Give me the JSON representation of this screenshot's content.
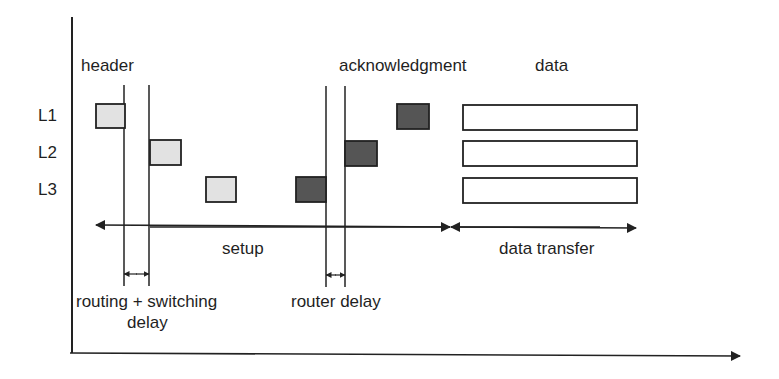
{
  "diagram": {
    "type": "timing-diagram",
    "labels": {
      "header": "header",
      "acknowledgment": "acknowledgment",
      "data": "data",
      "setup": "setup",
      "data_transfer": "data transfer",
      "routing_switching_line1": "routing + switching",
      "routing_switching_line2": "delay",
      "router_delay": "router delay"
    },
    "links": [
      {
        "id": "L1",
        "label": "L1"
      },
      {
        "id": "L2",
        "label": "L2"
      },
      {
        "id": "L3",
        "label": "L3"
      }
    ],
    "colors": {
      "line": "#222222",
      "header_fill": "#e2e2e2",
      "ack_fill": "#555555",
      "data_fill": "#ffffff"
    },
    "phases": [
      "setup",
      "data transfer"
    ]
  }
}
